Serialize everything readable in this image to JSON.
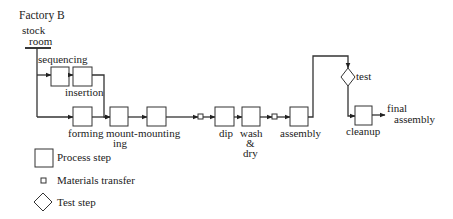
{
  "title": "Factory B",
  "source": {
    "line1": "stock",
    "line2": "room"
  },
  "steps": {
    "sequencing": "sequencing",
    "insertion": "insertion",
    "forming": "forming",
    "mount_ing_line1": "mount-",
    "mount_ing_line2": "ing",
    "mounting": "mounting",
    "dip": "dip",
    "wash_line1": "wash",
    "wash_line2": "&",
    "wash_line3": "dry",
    "assembly": "assembly",
    "test": "test",
    "cleanup": "cleanup",
    "final_line1": "final",
    "final_line2": "assembly"
  },
  "legend": [
    {
      "symbol": "square-box",
      "label": "Process step"
    },
    {
      "symbol": "small-square",
      "label": "Materials transfer"
    },
    {
      "symbol": "diamond",
      "label": "Test step"
    }
  ],
  "colors": {
    "stroke": "#333333",
    "text": "#222222",
    "background": "#ffffff"
  }
}
